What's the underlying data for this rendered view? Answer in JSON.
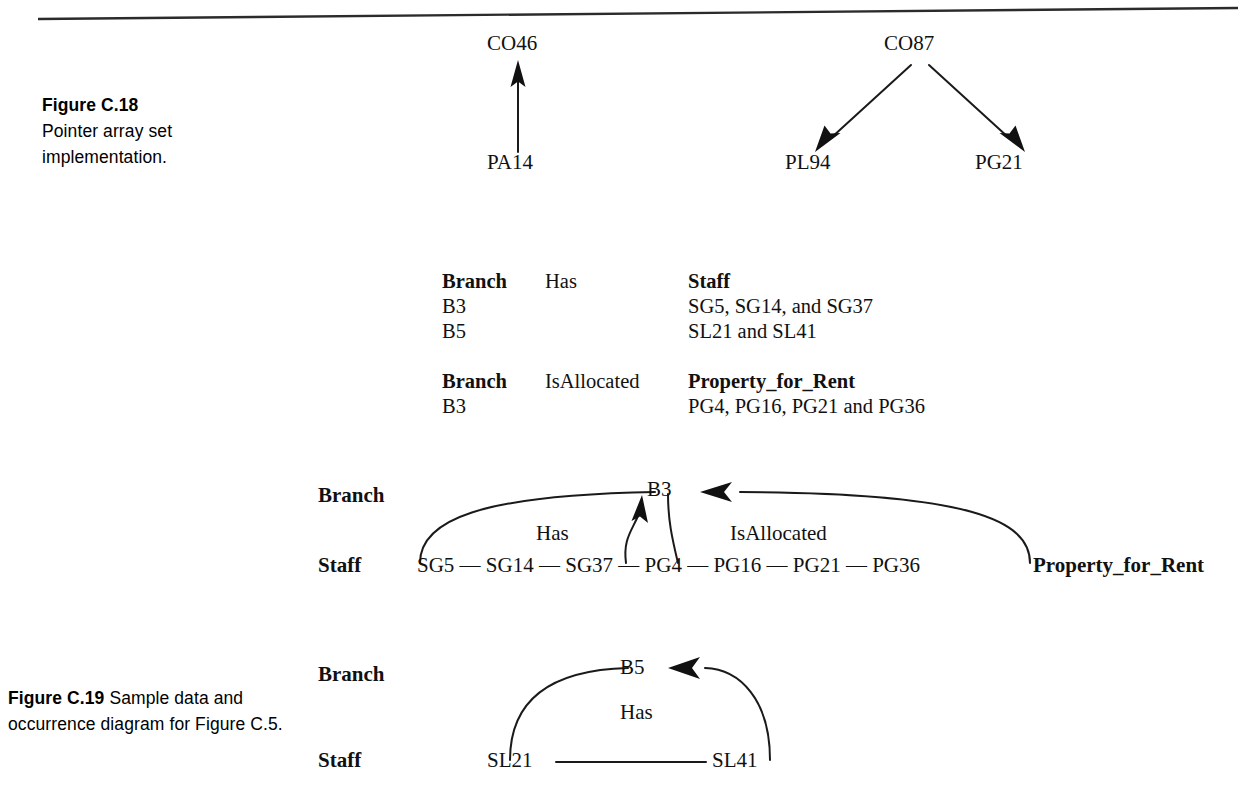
{
  "figure_c18": {
    "caption_label": "Figure C.18",
    "caption_text": "Pointer array set implementation.",
    "left_group": {
      "target": "CO46",
      "source": "PA14"
    },
    "right_group": {
      "source": "CO87",
      "targets": [
        "PL94",
        "PG21"
      ]
    }
  },
  "figure_c19": {
    "caption_label": "Figure C.19",
    "caption_text": "Sample data and occurrence diagram for Figure C.5.",
    "tables": [
      {
        "col1_header": "Branch",
        "relationship": "Has",
        "col2_header": "Staff",
        "rows": [
          {
            "left": "B3",
            "right": "SG5, SG14, and SG37"
          },
          {
            "left": "B5",
            "right": "SL21 and SL41"
          }
        ]
      },
      {
        "col1_header": "Branch",
        "relationship": "IsAllocated",
        "col2_header": "Property_for_Rent",
        "rows": [
          {
            "left": "B3",
            "right": "PG4, PG16, PG21 and PG36"
          }
        ]
      }
    ],
    "occurrence_b3": {
      "row_label_top": "Branch",
      "row_label_bottom": "Staff",
      "entity_right_label": "Property_for_Rent",
      "node": "B3",
      "rel_left": "Has",
      "rel_right": "IsAllocated",
      "chain": [
        "SG5",
        "SG14",
        "SG37",
        "PG4",
        "PG16",
        "PG21",
        "PG36"
      ]
    },
    "occurrence_b5": {
      "row_label_top": "Branch",
      "row_label_bottom": "Staff",
      "node": "B5",
      "rel": "Has",
      "chain": [
        "SL21",
        "SL41"
      ]
    }
  },
  "colors": {
    "ink": "#111111",
    "paper": "#ffffff"
  }
}
